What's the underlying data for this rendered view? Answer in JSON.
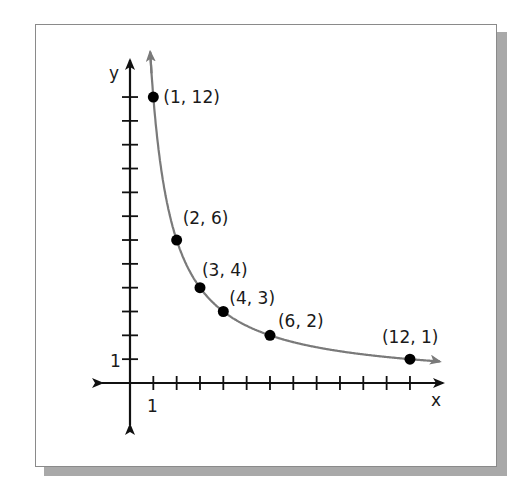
{
  "chart_data": {
    "type": "scatter",
    "title": "",
    "xlabel": "x",
    "ylabel": "y",
    "x_tick_label": "1",
    "y_tick_label": "1",
    "xlim": [
      -1.5,
      13.5
    ],
    "ylim": [
      -2,
      13.5
    ],
    "grid": false,
    "series": [
      {
        "name": "y = 12/x",
        "curve": "hyperbola",
        "points": [
          {
            "x": 1,
            "y": 12,
            "label": "(1, 12)"
          },
          {
            "x": 2,
            "y": 6,
            "label": "(2, 6)"
          },
          {
            "x": 3,
            "y": 4,
            "label": "(3, 4)"
          },
          {
            "x": 4,
            "y": 3,
            "label": "(4, 3)"
          },
          {
            "x": 6,
            "y": 2,
            "label": "(6, 2)"
          },
          {
            "x": 12,
            "y": 1,
            "label": "(12, 1)"
          }
        ]
      }
    ],
    "x_ticks": [
      1,
      2,
      3,
      4,
      5,
      6,
      7,
      8,
      9,
      10,
      11,
      12
    ],
    "y_ticks": [
      1,
      2,
      3,
      4,
      5,
      6,
      7,
      8,
      9,
      10,
      11,
      12
    ]
  },
  "colors": {
    "axis": "#111111",
    "curve": "#7a7a7a",
    "point": "#000000",
    "shadow": "#a9a9a9"
  }
}
